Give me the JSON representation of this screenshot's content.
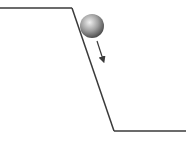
{
  "diagram": {
    "colors": {
      "line": "#3a3a3a",
      "ball_light": "#e8e8e8",
      "ball_mid": "#9a9a9a",
      "ball_dark": "#4a4a4a",
      "arrow": "#3a3a3a",
      "background": "#ffffff"
    },
    "elements": {
      "upper_ledge": {
        "x1": 0,
        "y1": 8,
        "x2": 72,
        "y2": 8
      },
      "slope": {
        "x1": 72,
        "y1": 8,
        "x2": 114,
        "y2": 131
      },
      "lower_ledge": {
        "x1": 114,
        "y1": 131,
        "x2": 186,
        "y2": 131
      },
      "ball": {
        "cx": 92,
        "cy": 26,
        "r": 12
      },
      "velocity_arrow": {
        "x1": 97,
        "y1": 41,
        "x2": 104,
        "y2": 63
      }
    }
  }
}
